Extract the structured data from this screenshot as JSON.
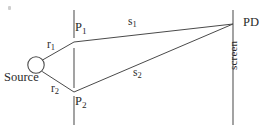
{
  "figure": {
    "width": 273,
    "height": 130,
    "background_color": "#ffffff",
    "ink_color": "#4a4a4a",
    "label_color": "#2b2b2b"
  },
  "labels": {
    "source": "Source",
    "r1": "r",
    "r1_sub": "1",
    "r2": "r",
    "r2_sub": "2",
    "p1": "P",
    "p1_sub": "1",
    "p2": "P",
    "p2_sub": "2",
    "s1": "s",
    "s1_sub": "1",
    "s2": "s",
    "s2_sub": "2",
    "pd": "PD",
    "screen": "screen"
  },
  "geometry": {
    "source_circle": {
      "cx": 36,
      "cy": 65,
      "r": 8.2
    },
    "slit_plane_x": 74,
    "slit_segments": [
      {
        "x": 74,
        "y1": 10,
        "y2": 38
      },
      {
        "x": 74,
        "y1": 48,
        "y2": 88
      },
      {
        "x": 74,
        "y1": 96,
        "y2": 125
      }
    ],
    "slit_p1": {
      "x": 74,
      "y": 42
    },
    "slit_p2": {
      "x": 74,
      "y": 92
    },
    "screen_line": {
      "x": 233,
      "y1": 10,
      "y2": 125
    },
    "detector_pd": {
      "x": 233,
      "y": 24
    },
    "rays": [
      {
        "name": "r1",
        "from": "source",
        "to": "p1",
        "x1": 42,
        "y1": 60,
        "x2": 74,
        "y2": 42
      },
      {
        "name": "r2",
        "from": "source",
        "to": "p2",
        "x1": 42,
        "y1": 71,
        "x2": 74,
        "y2": 92
      },
      {
        "name": "s1",
        "from": "p1",
        "to": "pd",
        "x1": 74,
        "y1": 42,
        "x2": 233,
        "y2": 24
      },
      {
        "name": "s2",
        "from": "p2",
        "to": "pd",
        "x1": 74,
        "y1": 92,
        "x2": 233,
        "y2": 24
      }
    ]
  }
}
